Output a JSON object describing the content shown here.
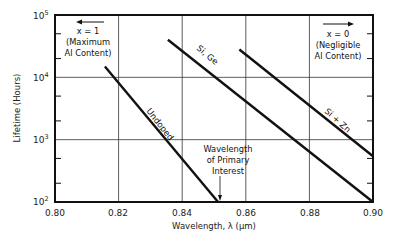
{
  "chart_data": {
    "type": "line",
    "title": "",
    "xlabel": "Wavelength, λ  (μm)",
    "ylabel": "Lifetime (Hours)",
    "xlim": [
      0.8,
      0.9
    ],
    "ylim": [
      100,
      100000
    ],
    "yscale": "log",
    "grid": true,
    "x_ticks": [
      "0.80",
      "0.82",
      "0.84",
      "0.86",
      "0.88",
      "0.90"
    ],
    "y_ticks": [
      {
        "base": "10",
        "exp": "2"
      },
      {
        "base": "10",
        "exp": "3"
      },
      {
        "base": "10",
        "exp": "4"
      },
      {
        "base": "10",
        "exp": "5"
      }
    ],
    "series": [
      {
        "name": "Undoped",
        "x": [
          0.8157,
          0.8513
        ],
        "y": [
          15000,
          100
        ]
      },
      {
        "name": "Si, Ge",
        "x": [
          0.8355,
          0.9
        ],
        "y": [
          40000,
          100
        ]
      },
      {
        "name": "Si + Zn",
        "x": [
          0.858,
          0.9
        ],
        "y": [
          28000,
          540
        ]
      }
    ],
    "annotations": [
      {
        "lines": [
          "x = 1",
          "(Maximum",
          "Al Content)"
        ],
        "arrow": "left"
      },
      {
        "lines": [
          "x = 0",
          "(Negligible",
          "Al Content)"
        ],
        "arrow": "right"
      },
      {
        "lines": [
          "Wavelength",
          "of Primary",
          "Interest"
        ],
        "arrow": "down",
        "x": 0.852
      }
    ]
  }
}
